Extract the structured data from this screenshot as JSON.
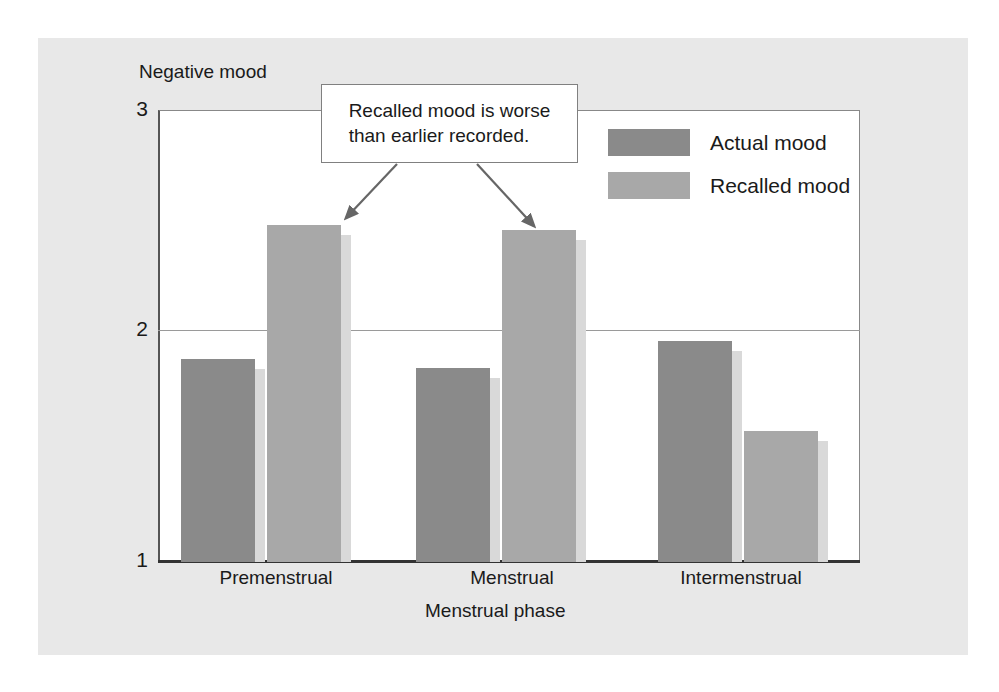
{
  "figure": {
    "background_color": "#e8e8e8",
    "plot_background_color": "#ffffff"
  },
  "annotation": {
    "callout_text": "Recalled mood is worse than earlier recorded.",
    "callout_line_1": "Recalled mood is worse",
    "callout_line_2": "than earlier recorded.",
    "arrow_targets": [
      "Premenstrual recalled bar",
      "Menstrual recalled bar"
    ]
  },
  "legend": {
    "position": "top-right inside plot",
    "entries": [
      {
        "label": "Actual mood",
        "color": "#8a8a8a"
      },
      {
        "label": "Recalled mood",
        "color": "#a8a8a8"
      }
    ]
  },
  "chart_data": {
    "type": "bar",
    "title": "",
    "subtitle": "",
    "xlabel": "Menstrual phase",
    "ylabel": "Negative mood",
    "categories": [
      "Premenstrual",
      "Menstrual",
      "Intermenstrual"
    ],
    "series": [
      {
        "name": "Actual mood",
        "color": "#8a8a8a",
        "values": [
          1.9,
          1.86,
          1.98
        ]
      },
      {
        "name": "Recalled mood",
        "color": "#a8a8a8",
        "values": [
          2.49,
          2.47,
          1.58
        ]
      }
    ],
    "ylim": [
      1,
      3
    ],
    "yticks": [
      1,
      2,
      3
    ],
    "ytick_labels": [
      "1",
      "2",
      "3"
    ],
    "grid": "horizontal gridline at y=2 only",
    "legend_position": "upper right",
    "annotations": [
      {
        "text": "Recalled mood is worse than earlier recorded.",
        "points_to": [
          "Premenstrual / Recalled mood",
          "Menstrual / Recalled mood"
        ]
      }
    ]
  }
}
